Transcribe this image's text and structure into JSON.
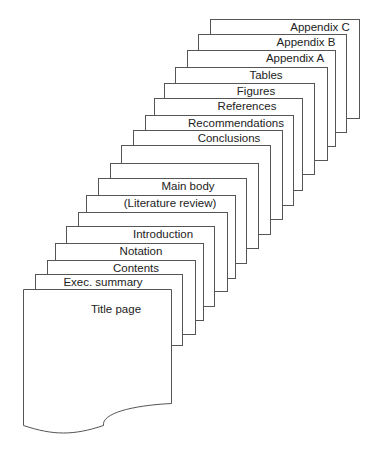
{
  "diagram": {
    "type": "stacked-pages",
    "pages": [
      {
        "label": "Appendix C",
        "x": 210,
        "y": 19,
        "w": 149,
        "h": 300,
        "lx": 320
      },
      {
        "label": "Appendix B",
        "x": 198,
        "y": 34,
        "w": 148,
        "h": 300,
        "lx": 306
      },
      {
        "label": "Appendix A",
        "x": 187,
        "y": 50,
        "w": 148,
        "h": 300,
        "lx": 295
      },
      {
        "label": "Tables",
        "x": 175,
        "y": 67,
        "w": 152,
        "h": 300,
        "lx": 266
      },
      {
        "label": "Figures",
        "x": 164,
        "y": 83,
        "w": 150,
        "h": 300,
        "lx": 256
      },
      {
        "label": "References",
        "x": 154,
        "y": 98,
        "w": 148,
        "h": 300,
        "lx": 247
      },
      {
        "label": "Recommendations",
        "x": 145,
        "y": 115,
        "w": 148,
        "h": 300,
        "lx": 236
      },
      {
        "label": "Conclusions",
        "x": 133,
        "y": 130,
        "w": 149,
        "h": 300,
        "lx": 229
      },
      {
        "label": "",
        "x": 121,
        "y": 145,
        "w": 149,
        "h": 300,
        "lx": 0
      },
      {
        "label": "",
        "x": 110,
        "y": 163,
        "w": 148,
        "h": 300,
        "lx": 0
      },
      {
        "label": "Main body",
        "x": 98,
        "y": 178,
        "w": 148,
        "h": 300,
        "lx": 188
      },
      {
        "label": "(Literature review)",
        "x": 86,
        "y": 195,
        "w": 149,
        "h": 300,
        "lx": 170
      },
      {
        "label": "",
        "x": 78,
        "y": 212,
        "w": 149,
        "h": 300,
        "lx": 0
      },
      {
        "label": "Introduction",
        "x": 66,
        "y": 226,
        "w": 148,
        "h": 300,
        "lx": 163
      },
      {
        "label": "Notation",
        "x": 55,
        "y": 243,
        "w": 148,
        "h": 300,
        "lx": 141
      },
      {
        "label": "Contents",
        "x": 47,
        "y": 260,
        "w": 148,
        "h": 300,
        "lx": 136
      },
      {
        "label": "Exec. summary",
        "x": 35,
        "y": 274,
        "w": 147,
        "h": 300,
        "lx": 103
      }
    ],
    "bottoms": [
      68,
      82,
      96,
      110,
      124,
      138,
      152,
      166,
      180,
      194,
      208,
      222,
      236,
      250,
      264,
      278,
      290
    ],
    "title_page": {
      "label": "Title page",
      "x": 23,
      "y": 289,
      "w": 148,
      "lx": 116
    }
  }
}
